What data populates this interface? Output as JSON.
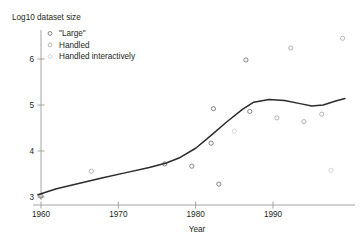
{
  "figure": {
    "ylabel": "Log10 dataset size",
    "xlabel": "Year"
  },
  "legend": {
    "items": [
      {
        "label": "\"Large\"",
        "marker": "open-circle",
        "color": "#6f6f6f"
      },
      {
        "label": "Handled",
        "marker": "open-circle",
        "color": "#a8a8a8"
      },
      {
        "label": "Handled interactively",
        "marker": "open-circle",
        "color": "#cfcfcf"
      }
    ]
  },
  "chart_data": {
    "type": "scatter",
    "title": "",
    "xlabel": "Year",
    "ylabel": "Log10 dataset size",
    "xlim": [
      1958,
      2000
    ],
    "ylim": [
      2.9,
      6.6
    ],
    "xticks": [
      1960,
      1970,
      1980,
      1990
    ],
    "yticks": [
      3,
      4,
      5,
      6
    ],
    "xtick_labels": [
      "1960",
      "1970",
      "1980",
      "1990"
    ],
    "ytick_labels": [
      "3",
      "4",
      "5",
      "6"
    ],
    "grid": false,
    "legend_position": "upper-left",
    "series": [
      {
        "name": "\"Large\"",
        "color": "#6f6f6f",
        "marker": "open-circle",
        "points": [
          {
            "x": 1960.0,
            "y": 3.02
          },
          {
            "x": 1976.0,
            "y": 3.72
          },
          {
            "x": 1979.5,
            "y": 3.67
          },
          {
            "x": 1982.0,
            "y": 4.17
          },
          {
            "x": 1983.0,
            "y": 3.28
          },
          {
            "x": 1982.3,
            "y": 4.92
          },
          {
            "x": 1986.5,
            "y": 5.98
          },
          {
            "x": 1987.0,
            "y": 4.86
          }
        ]
      },
      {
        "name": "Handled",
        "color": "#a8a8a8",
        "marker": "open-circle",
        "points": [
          {
            "x": 1966.5,
            "y": 3.56
          },
          {
            "x": 1990.5,
            "y": 4.72
          },
          {
            "x": 1994.0,
            "y": 4.64
          },
          {
            "x": 1992.3,
            "y": 6.24
          },
          {
            "x": 1996.3,
            "y": 4.8
          },
          {
            "x": 1999.0,
            "y": 6.45
          }
        ]
      },
      {
        "name": "Handled interactively",
        "color": "#cfcfcf",
        "marker": "open-circle",
        "points": [
          {
            "x": 1985.0,
            "y": 4.43
          },
          {
            "x": 1997.5,
            "y": 3.58
          }
        ]
      }
    ],
    "trend_line": {
      "name": "trend",
      "color": "#2b2b2b",
      "points": [
        {
          "x": 1959.6,
          "y": 3.05
        },
        {
          "x": 1962.0,
          "y": 3.18
        },
        {
          "x": 1965.0,
          "y": 3.3
        },
        {
          "x": 1968.0,
          "y": 3.42
        },
        {
          "x": 1971.0,
          "y": 3.53
        },
        {
          "x": 1974.0,
          "y": 3.64
        },
        {
          "x": 1976.2,
          "y": 3.74
        },
        {
          "x": 1978.0,
          "y": 3.86
        },
        {
          "x": 1980.0,
          "y": 4.06
        },
        {
          "x": 1982.0,
          "y": 4.34
        },
        {
          "x": 1984.0,
          "y": 4.63
        },
        {
          "x": 1986.0,
          "y": 4.9
        },
        {
          "x": 1987.5,
          "y": 5.06
        },
        {
          "x": 1989.5,
          "y": 5.12
        },
        {
          "x": 1991.5,
          "y": 5.1
        },
        {
          "x": 1993.5,
          "y": 5.03
        },
        {
          "x": 1995.0,
          "y": 4.98
        },
        {
          "x": 1996.5,
          "y": 5.0
        },
        {
          "x": 1998.0,
          "y": 5.08
        },
        {
          "x": 1999.3,
          "y": 5.14
        }
      ]
    }
  }
}
